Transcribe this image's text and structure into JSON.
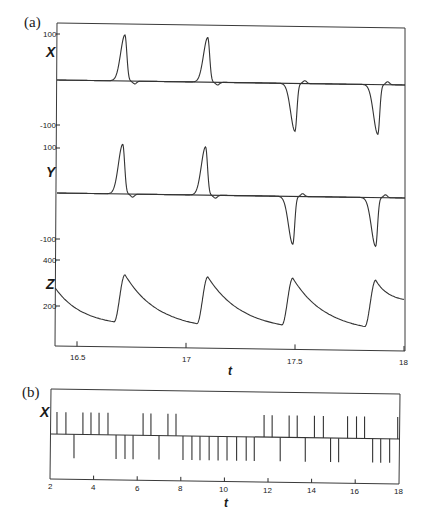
{
  "chart_data": [
    {
      "panel": "(a)",
      "type": "line",
      "title": "",
      "xlabel": "t",
      "xlim": [
        16.4,
        18.0
      ],
      "xticks": [
        "16.5",
        "17",
        "17.5",
        "18"
      ],
      "grid": false,
      "legend": null,
      "subplots": [
        {
          "ylabel": "X",
          "yticks": [
            "100",
            "-100"
          ],
          "ylim": [
            -110,
            110
          ],
          "events": [
            {
              "t": 16.72,
              "type": "peak",
              "value": 100
            },
            {
              "t": 17.1,
              "type": "peak",
              "value": 97
            },
            {
              "t": 17.5,
              "type": "trough",
              "value": -104
            },
            {
              "t": 17.88,
              "type": "trough",
              "value": -108
            }
          ],
          "baseline": 0
        },
        {
          "ylabel": "Y",
          "yticks": [
            "100",
            "-100"
          ],
          "ylim": [
            -110,
            110
          ],
          "events": [
            {
              "t": 16.71,
              "type": "peak",
              "value": 108
            },
            {
              "t": 17.09,
              "type": "peak",
              "value": 105
            },
            {
              "t": 17.49,
              "type": "trough",
              "value": -104
            },
            {
              "t": 17.87,
              "type": "trough",
              "value": -106
            }
          ],
          "baseline": 0
        },
        {
          "ylabel": "Z",
          "yticks": [
            "400",
            "200"
          ],
          "ylim": [
            0,
            420
          ],
          "sawtooth": {
            "start_value": 278,
            "troughs": [
              {
                "t": 16.67,
                "value": 135
              },
              {
                "t": 17.05,
                "value": 132
              },
              {
                "t": 17.44,
                "value": 132
              },
              {
                "t": 17.82,
                "value": 130
              }
            ],
            "peaks": [
              {
                "t": 16.72,
                "value": 340
              },
              {
                "t": 17.1,
                "value": 336
              },
              {
                "t": 17.49,
                "value": 336
              },
              {
                "t": 17.87,
                "value": 332
              }
            ],
            "end_value": 250
          }
        }
      ]
    },
    {
      "panel": "(b)",
      "type": "line",
      "title": "",
      "xlabel": "t",
      "ylabel": "X",
      "xlim": [
        2,
        18
      ],
      "xticks": [
        "2",
        "4",
        "6",
        "8",
        "10",
        "12",
        "14",
        "16",
        "18"
      ],
      "grid": false,
      "legend": null,
      "spike_train": [
        {
          "t": 2.32,
          "dir": 1
        },
        {
          "t": 2.73,
          "dir": 1
        },
        {
          "t": 3.1,
          "dir": -1
        },
        {
          "t": 3.51,
          "dir": 1
        },
        {
          "t": 3.88,
          "dir": 1
        },
        {
          "t": 4.25,
          "dir": 1
        },
        {
          "t": 4.66,
          "dir": 1
        },
        {
          "t": 5.03,
          "dir": -1
        },
        {
          "t": 5.44,
          "dir": -1
        },
        {
          "t": 5.81,
          "dir": -1
        },
        {
          "t": 6.27,
          "dir": 1
        },
        {
          "t": 6.63,
          "dir": 1
        },
        {
          "t": 7.0,
          "dir": -1
        },
        {
          "t": 7.41,
          "dir": 1
        },
        {
          "t": 7.78,
          "dir": 1
        },
        {
          "t": 8.1,
          "dir": -1
        },
        {
          "t": 8.51,
          "dir": -1
        },
        {
          "t": 8.88,
          "dir": -1
        },
        {
          "t": 9.3,
          "dir": -1
        },
        {
          "t": 9.71,
          "dir": -1
        },
        {
          "t": 10.12,
          "dir": -1
        },
        {
          "t": 10.56,
          "dir": -1
        },
        {
          "t": 11.0,
          "dir": -1
        },
        {
          "t": 11.37,
          "dir": -1
        },
        {
          "t": 11.82,
          "dir": 1
        },
        {
          "t": 12.19,
          "dir": 1
        },
        {
          "t": 12.56,
          "dir": -1
        },
        {
          "t": 12.97,
          "dir": 1
        },
        {
          "t": 13.34,
          "dir": 1
        },
        {
          "t": 13.71,
          "dir": -1
        },
        {
          "t": 14.13,
          "dir": 1
        },
        {
          "t": 14.54,
          "dir": 1
        },
        {
          "t": 14.87,
          "dir": -1
        },
        {
          "t": 15.24,
          "dir": -1
        },
        {
          "t": 15.65,
          "dir": 1
        },
        {
          "t": 16.06,
          "dir": 1
        },
        {
          "t": 16.43,
          "dir": 1
        },
        {
          "t": 16.8,
          "dir": -1
        },
        {
          "t": 17.17,
          "dir": -1
        },
        {
          "t": 17.58,
          "dir": -1
        },
        {
          "t": 17.95,
          "dir": 1
        }
      ]
    }
  ],
  "labels": {
    "panel_a": "(a)",
    "panel_b": "(b)",
    "x_label": "X",
    "y_label": "Y",
    "z_label": "Z",
    "b_x_label": "X",
    "a_xaxis": "t",
    "b_xaxis": "t",
    "x_ticks_a": [
      "100",
      "-100"
    ],
    "y_ticks_a": [
      "100",
      "-100"
    ],
    "z_ticks_a": [
      "400",
      "200"
    ],
    "t_ticks_a": [
      "16.5",
      "17",
      "17.5",
      "18"
    ],
    "t_ticks_b": [
      "2",
      "4",
      "6",
      "8",
      "10",
      "12",
      "14",
      "16",
      "18"
    ]
  },
  "colors": {
    "ink": "#333333",
    "background": "#ffffff"
  }
}
